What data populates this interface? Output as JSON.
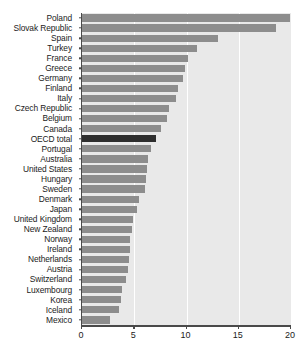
{
  "chart_data": {
    "type": "bar",
    "orientation": "horizontal",
    "title": "",
    "subtitle": "",
    "xlabel": "",
    "ylabel": "",
    "xlim": [
      0,
      20
    ],
    "xticks": [
      0,
      5,
      10,
      15,
      20
    ],
    "xtick_labels": [
      "0",
      "5",
      "10",
      "15",
      "20"
    ],
    "grid": true,
    "grid_axis": "x",
    "legend": false,
    "highlight_category": "OECD total",
    "colors": {
      "bar": "#8d8d8d",
      "highlight_bar": "#2e2e2e",
      "plot_background": "#e9e9e9",
      "gridline": "#ffffff",
      "axis": "#4a4a4a",
      "text": "#1b1b1b",
      "page_background": "#ffffff"
    },
    "categories": [
      "Poland",
      "Slovak Republic",
      "Spain",
      "Turkey",
      "France",
      "Greece",
      "Germany",
      "Finland",
      "Italy",
      "Czech Republic",
      "Belgium",
      "Canada",
      "OECD total",
      "Portugal",
      "Australia",
      "United States",
      "Hungary",
      "Sweden",
      "Denmark",
      "Japan",
      "United Kingdom",
      "New Zealand",
      "Norway",
      "Ireland",
      "Netherlands",
      "Austria",
      "Switzerland",
      "Luxembourg",
      "Korea",
      "Iceland",
      "Mexico"
    ],
    "values": [
      19.9,
      18.6,
      13.0,
      11.0,
      10.1,
      9.9,
      9.7,
      9.2,
      9.0,
      8.3,
      8.1,
      7.6,
      7.1,
      6.6,
      6.3,
      6.2,
      6.1,
      6.0,
      5.5,
      5.3,
      4.9,
      4.8,
      4.6,
      4.6,
      4.5,
      4.4,
      4.2,
      3.8,
      3.7,
      3.5,
      2.7
    ]
  }
}
